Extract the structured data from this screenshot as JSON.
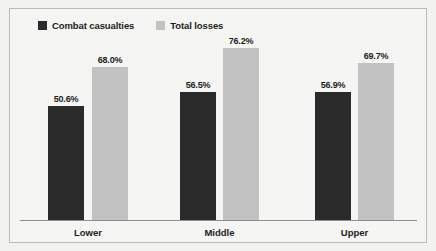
{
  "chart_data": {
    "type": "bar",
    "title": "",
    "subtitle": "",
    "xlabel": "",
    "ylabel": "",
    "categories": [
      "Lower",
      "Middle",
      "Upper"
    ],
    "series": [
      {
        "name": "Combat casualties",
        "color": "#2b2b2b",
        "values": [
          50.6,
          56.9,
          56.9
        ],
        "labels": [
          "50.6%",
          "56.5%",
          "56.9%"
        ]
      },
      {
        "name": "Total losses",
        "color": "#c2c2c2",
        "values": [
          68.0,
          76.2,
          69.7
        ],
        "labels": [
          "68.0%",
          "76.2%",
          "69.7%"
        ]
      }
    ],
    "values_by_group": [
      {
        "category": "Lower",
        "combat_casualties": 50.6,
        "total_losses": 68.0
      },
      {
        "category": "Middle",
        "combat_casualties": 56.5,
        "total_losses": 76.2
      },
      {
        "category": "Upper",
        "combat_casualties": 56.9,
        "total_losses": 69.7
      }
    ],
    "ylim": [
      0,
      80
    ],
    "grid": false,
    "legend_position": "top-left",
    "data_labels": true,
    "y_axis_visible": false
  },
  "legend": {
    "entries": [
      {
        "label": "Combat casualties",
        "color": "#2b2b2b"
      },
      {
        "label": "Total losses",
        "color": "#c2c2c2"
      }
    ]
  },
  "axis": {
    "tick_labels": [
      "Lower",
      "Middle",
      "Upper"
    ]
  },
  "colors": {
    "background": "#f2f2f0",
    "plot_background": "#f5f5f3",
    "frame_border": "#b9b9b6",
    "axis_line": "#8e8e8c",
    "text": "#1d1d1d",
    "series_dark": "#2b2b2b",
    "series_light": "#c2c2c2"
  }
}
